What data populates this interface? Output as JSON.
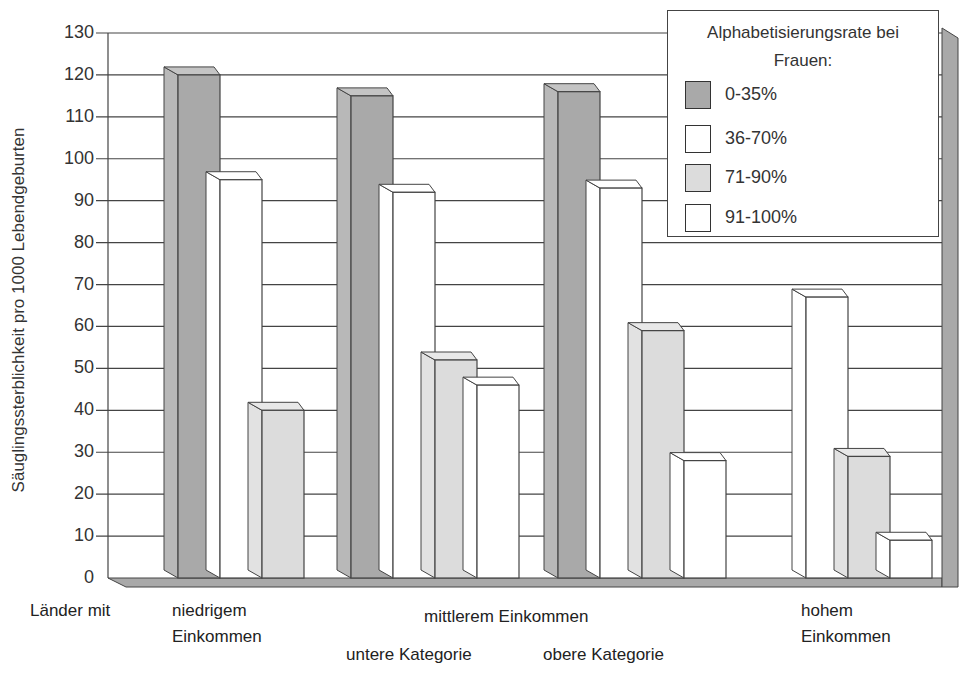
{
  "chart_data": {
    "type": "bar",
    "title": "",
    "ylabel": "Säuglingssterblichkeit  pro 1000 Lebendgeburten",
    "xlabel": "Länder mit",
    "ylim": [
      0,
      130
    ],
    "yticks": [
      0,
      10,
      20,
      30,
      40,
      50,
      60,
      70,
      80,
      90,
      100,
      110,
      120,
      130
    ],
    "grid": true,
    "legend_position": "top-right",
    "legend_title": "Alphabetisierungsrate bei Frauen:",
    "categories": [
      "niedrigem Einkommen",
      "mittlerem Einkommen – untere Kategorie",
      "mittlerem Einkommen – obere Kategorie",
      "hohem Einkommen"
    ],
    "series": [
      {
        "name": "0-35%",
        "color": "#a9a9a9",
        "values": [
          120,
          115,
          116,
          null
        ]
      },
      {
        "name": "36-70%",
        "color": "#ffffff",
        "values": [
          95,
          92,
          93,
          67
        ]
      },
      {
        "name": "71-90%",
        "color": "#dcdcdc",
        "values": [
          40,
          52,
          59,
          29
        ]
      },
      {
        "name": "91-100%",
        "color": "#ffffff",
        "values": [
          null,
          46,
          28,
          9
        ]
      }
    ]
  },
  "axis": {
    "ylabel": "Säuglingssterblichkeit  pro 1000 Lebendgeburten",
    "ticks": [
      "130",
      "120",
      "110",
      "100",
      "90",
      "80",
      "70",
      "60",
      "50",
      "40",
      "30",
      "20",
      "10",
      "0"
    ]
  },
  "xlabels": {
    "prefix": "Länder mit",
    "low_line1": "niedrigem",
    "low_line2": "Einkommen",
    "middle": "mittlerem Einkommen",
    "lower_cat": "untere Kategorie",
    "upper_cat": "obere Kategorie",
    "high_line1": "hohem",
    "high_line2": "Einkommen"
  },
  "legend": {
    "title_line1": "Alphabetisierungsrate bei",
    "title_line2": "Frauen:",
    "items": [
      {
        "label": "0-35%",
        "color": "#a9a9a9"
      },
      {
        "label": "36-70%",
        "color": "#ffffff"
      },
      {
        "label": "71-90%",
        "color": "#dcdcdc"
      },
      {
        "label": "91-100%",
        "color": "#ffffff"
      }
    ]
  }
}
